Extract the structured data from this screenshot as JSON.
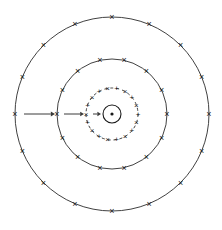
{
  "figure": {
    "background_color": "#ffffff",
    "line_color": "#2b2b2b",
    "marker_color": "#1a1a1a",
    "arrow_color": "#3a3a3a",
    "center": {
      "x": 112,
      "y": 114
    }
  },
  "nucleus": {
    "label": "nucleus",
    "outer_radius": 9,
    "dot_radius": 1.6,
    "stroke": "#1a1a1a"
  },
  "shells": [
    {
      "name": "inner-shell",
      "radius": 26,
      "dashed": true,
      "dash_pattern": "3 3",
      "stroke_width": 0.9,
      "marker_count": 18,
      "marker_size": 8,
      "markers": [
        "×",
        "+",
        "×",
        "+",
        "×",
        "+",
        "×",
        "+",
        "×",
        "+",
        "×",
        "+",
        "×",
        "+",
        "×",
        "+",
        "×",
        "+"
      ],
      "start_angle": 180
    },
    {
      "name": "middle-shell",
      "radius": 55,
      "dashed": false,
      "dash_pattern": "",
      "stroke_width": 0.9,
      "marker_count": 14,
      "marker_size": 9,
      "markers": [
        "×",
        "×",
        "×",
        "×",
        "×",
        "×",
        "×",
        "×",
        "×",
        "×",
        "×",
        "×",
        "×",
        "×"
      ],
      "start_angle": 180
    },
    {
      "name": "outer-shell",
      "radius": 97,
      "dashed": false,
      "dash_pattern": "",
      "stroke_width": 0.9,
      "marker_count": 16,
      "marker_size": 9,
      "markers": [
        "×",
        "×",
        "×",
        "×",
        "×",
        "×",
        "×",
        "×",
        "×",
        "×",
        "×",
        "×",
        "×",
        "×",
        "×",
        "×"
      ],
      "start_angle": 180
    }
  ],
  "arrows": [
    {
      "name": "arrow-outer-to-middle",
      "x1": 24,
      "y1": 114,
      "x2": 55,
      "y2": 114,
      "head_size": 4.2,
      "stroke_width": 1.0
    },
    {
      "name": "arrow-middle-to-inner",
      "x1": 64,
      "y1": 114,
      "x2": 84,
      "y2": 114,
      "head_size": 3.8,
      "stroke_width": 1.0
    },
    {
      "name": "arrow-inner-to-nucleus",
      "x1": 93,
      "y1": 114,
      "x2": 101,
      "y2": 114,
      "head_size": 3.6,
      "stroke_width": 1.0
    }
  ]
}
